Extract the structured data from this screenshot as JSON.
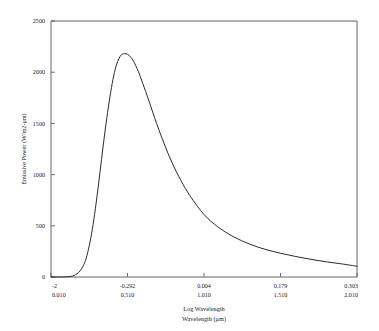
{
  "chart_data": {
    "type": "line",
    "title": "",
    "subtitle": "",
    "xlabel": "Log Wavelength",
    "xlabel2": "Wavelength (μm)",
    "ylabel": "Emissive Power (W/m2-μm)",
    "xlim": [
      0.01,
      2.01
    ],
    "ylim": [
      0,
      2500
    ],
    "grid": false,
    "legend": null,
    "legend_position": "none",
    "y_ticks": [
      0,
      500,
      1000,
      1500,
      2000,
      2500
    ],
    "y_tick_labels": [
      "0",
      "500",
      "1000",
      "1500",
      "2000",
      "2500"
    ],
    "x_ticks_wavelength": [
      0.01,
      0.51,
      1.01,
      1.51,
      2.01
    ],
    "x_tick_labels_log": [
      "-2",
      "-0.292",
      "0.004",
      "0.179",
      "0.303"
    ],
    "x_tick_labels_wavelength": [
      "0.010",
      "0.510",
      "1.010",
      "1.510",
      "2.010"
    ],
    "series": [
      {
        "name": "Spectral emissive power",
        "x": [
          0.01,
          0.06,
          0.11,
          0.16,
          0.2,
          0.23,
          0.25,
          0.27,
          0.29,
          0.31,
          0.33,
          0.35,
          0.37,
          0.39,
          0.41,
          0.43,
          0.45,
          0.47,
          0.49,
          0.51,
          0.53,
          0.55,
          0.58,
          0.61,
          0.65,
          0.7,
          0.75,
          0.8,
          0.86,
          0.92,
          1.01,
          1.1,
          1.2,
          1.31,
          1.41,
          1.51,
          1.61,
          1.71,
          1.81,
          1.91,
          2.01
        ],
        "y": [
          0,
          0,
          2,
          14,
          60,
          140,
          240,
          380,
          560,
          780,
          1020,
          1270,
          1500,
          1710,
          1890,
          2030,
          2120,
          2170,
          2180,
          2175,
          2150,
          2105,
          2010,
          1890,
          1720,
          1500,
          1300,
          1120,
          940,
          790,
          610,
          490,
          395,
          320,
          270,
          232,
          200,
          172,
          148,
          128,
          105
        ],
        "peak_x": 0.49,
        "peak_y": 2180,
        "end_y": 105
      }
    ],
    "annotations": []
  },
  "axis": {
    "y_title": "Emissive Power (W/m2-μm)",
    "x_title_log": "Log Wavelength",
    "x_title_wavelength": "Wavelength (μm)"
  },
  "colors": {
    "curve": "#2a2a2a",
    "frame": "#555555",
    "text": "#202020",
    "background": "#ffffff"
  }
}
